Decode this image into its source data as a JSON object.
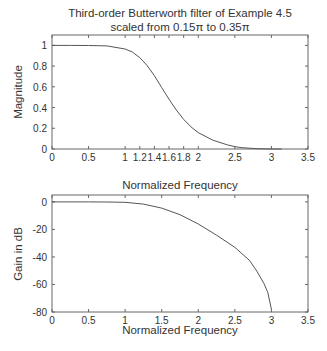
{
  "chart_data": [
    {
      "type": "line",
      "title": "Third-order Butterworth filter of Example 4.5",
      "subtitle": "scaled from 0.15π to 0.35π",
      "xlabel": "Normalized Frequency",
      "ylabel": "Magnitude",
      "xlim": [
        0,
        3.5
      ],
      "ylim": [
        0,
        1.1
      ],
      "grid": false,
      "xticks": [
        0,
        0.5,
        1,
        1.2,
        1.4,
        1.6,
        1.8,
        2,
        2.5,
        3,
        3.5
      ],
      "xtick_labels": [
        "0",
        "0.5",
        "1",
        "1.2",
        "1.4",
        "1.6",
        "1.8",
        "2",
        "2.5",
        "3",
        "3.5"
      ],
      "yticks": [
        0,
        0.2,
        0.4,
        0.6,
        0.8,
        1
      ],
      "ytick_labels": [
        "0",
        "0.2",
        "0.4",
        "0.6",
        "0.8",
        "1"
      ],
      "series": [
        {
          "name": "Magnitude",
          "x": [
            0,
            0.25,
            0.5,
            0.75,
            1.0,
            1.1,
            1.2,
            1.3,
            1.4,
            1.5,
            1.6,
            1.7,
            1.8,
            1.9,
            2.0,
            2.2,
            2.4,
            2.5,
            2.6,
            2.8,
            3.0,
            3.14
          ],
          "values": [
            1.0,
            1.0,
            0.999,
            0.995,
            0.965,
            0.935,
            0.881,
            0.806,
            0.707,
            0.592,
            0.481,
            0.376,
            0.286,
            0.213,
            0.157,
            0.085,
            0.04,
            0.022,
            0.013,
            0.003,
            0.0002,
            0.0
          ]
        }
      ]
    },
    {
      "type": "line",
      "title": "",
      "xlabel": "Normalized Frequency",
      "ylabel": "Gain in dB",
      "xlim": [
        0,
        3.5
      ],
      "ylim": [
        -80,
        5
      ],
      "grid": false,
      "xticks": [
        0,
        0.5,
        1,
        1.5,
        2,
        2.5,
        3,
        3.5
      ],
      "xtick_labels": [
        "0",
        "0.5",
        "1",
        "1.5",
        "2",
        "2.5",
        "3",
        "3.5"
      ],
      "yticks": [
        -80,
        -60,
        -40,
        -20,
        0
      ],
      "ytick_labels": [
        "-80",
        "-60",
        "-40",
        "-20",
        "0"
      ],
      "series": [
        {
          "name": "Gain (dB)",
          "x": [
            0,
            0.5,
            0.75,
            1.0,
            1.25,
            1.5,
            1.75,
            2.0,
            2.25,
            2.5,
            2.7,
            2.8,
            2.9,
            2.95,
            3.0
          ],
          "values": [
            0,
            0,
            -0.05,
            -0.31,
            -1.6,
            -4.5,
            -9.3,
            -16.1,
            -24.2,
            -33.1,
            -42.5,
            -50.3,
            -59.5,
            -65.8,
            -78.0
          ]
        }
      ]
    }
  ]
}
